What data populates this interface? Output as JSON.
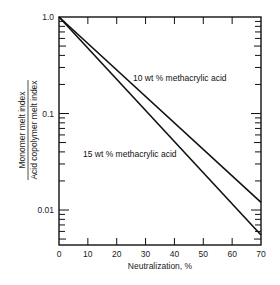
{
  "chart_data": {
    "type": "line",
    "title": "",
    "xlabel": "Neutralization, %",
    "ylabel_numerator": "Monomer melt index",
    "ylabel_denominator": "Acid copolymer melt index",
    "ylabel": "Monomer melt index / Acid copolymer melt index",
    "xscale": "linear",
    "yscale": "log",
    "xlim": [
      0,
      70
    ],
    "ylim": [
      0.0044,
      1.0
    ],
    "x_ticks": [
      0,
      10,
      20,
      30,
      40,
      50,
      60,
      70
    ],
    "x_tick_labels": [
      "0",
      "10",
      "20",
      "30",
      "40",
      "50",
      "60",
      "70"
    ],
    "y_tick_labels": [
      "1.0",
      "0.1",
      "0.01"
    ],
    "y_tick_values": [
      1.0,
      0.1,
      0.01
    ],
    "grid": false,
    "legend": "none (inline annotations)",
    "series": [
      {
        "name": "10 wt % methacrylic acid",
        "x": [
          0,
          70
        ],
        "values": [
          1.0,
          0.012
        ]
      },
      {
        "name": "15 wt % methacrylic acid",
        "x": [
          0,
          70
        ],
        "values": [
          1.0,
          0.0055
        ]
      }
    ],
    "annotations": [
      {
        "text": "10 wt % methacrylic acid",
        "series": 0
      },
      {
        "text": "15 wt % methacrylic acid",
        "series": 1
      }
    ]
  }
}
